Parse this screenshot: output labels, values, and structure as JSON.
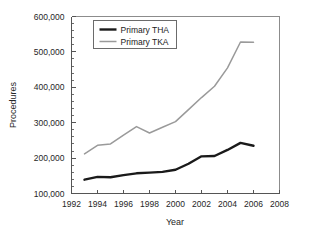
{
  "chart_data": {
    "type": "line",
    "title": "",
    "xlabel": "Year",
    "ylabel": "Procedures",
    "xlim": [
      1992,
      2008
    ],
    "ylim": [
      100000,
      600000
    ],
    "xticks": [
      1992,
      1994,
      1996,
      1998,
      2000,
      2002,
      2004,
      2006,
      2008
    ],
    "xtick_labels": [
      "1992",
      "1994",
      "1996",
      "1998",
      "2000",
      "2002",
      "2004",
      "2006",
      "2008"
    ],
    "yticks": [
      100000,
      200000,
      300000,
      400000,
      500000,
      600000
    ],
    "ytick_labels": [
      "100,000",
      "200,000",
      "300,000",
      "400,000",
      "500,000",
      "600,000"
    ],
    "grid": false,
    "legend_position": "upper-left-inside",
    "x": [
      1993,
      1994,
      1995,
      1996,
      1997,
      1998,
      1999,
      2000,
      2001,
      2002,
      2003,
      2004,
      2005,
      2006
    ],
    "series": [
      {
        "name": "Primary THA",
        "color": "#1a1a1a",
        "line_width": 2.4,
        "values": [
          139000,
          147000,
          146000,
          152000,
          157000,
          159000,
          161000,
          167000,
          184000,
          205000,
          206000,
          223000,
          243000,
          235000
        ]
      },
      {
        "name": "Primary TKA",
        "color": "#9a9a9a",
        "line_width": 1.5,
        "values": [
          212000,
          236000,
          240000,
          265000,
          289000,
          271000,
          287000,
          303000,
          337000,
          371000,
          403000,
          455000,
          528000,
          527000
        ]
      }
    ]
  },
  "legend": {
    "entries": [
      {
        "label": "Primary THA"
      },
      {
        "label": "Primary TKA"
      }
    ]
  },
  "axes": {
    "x_title": "Year",
    "y_title": "Procedures"
  }
}
